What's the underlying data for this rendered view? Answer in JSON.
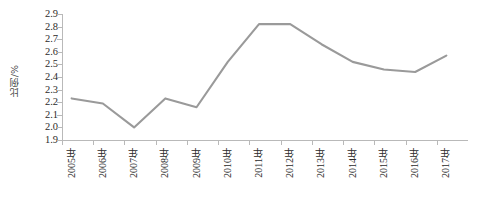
{
  "chart_data": {
    "type": "line",
    "title": "",
    "xlabel": "",
    "ylabel": "比例/%",
    "categories": [
      "2005年",
      "2006年",
      "2007年",
      "2008年",
      "2009年",
      "2010年",
      "2011年",
      "2012年",
      "2013年",
      "2014年",
      "2015年",
      "2016年",
      "2017年"
    ],
    "values": [
      2.23,
      2.19,
      2.0,
      2.23,
      2.16,
      2.52,
      2.82,
      2.82,
      2.66,
      2.52,
      2.46,
      2.44,
      2.57
    ],
    "series": [
      {
        "name": "比例",
        "values": [
          2.23,
          2.19,
          2.0,
          2.23,
          2.16,
          2.52,
          2.82,
          2.82,
          2.66,
          2.52,
          2.46,
          2.44,
          2.57
        ]
      }
    ],
    "ylim": [
      1.9,
      2.9
    ],
    "ytick_labels": [
      "2.9",
      "2.8",
      "2.7",
      "2.6",
      "2.5",
      "2.4",
      "2.3",
      "2.2",
      "2.1",
      "2.0",
      "1.9"
    ],
    "ytick_values": [
      2.9,
      2.8,
      2.7,
      2.6,
      2.5,
      2.4,
      2.3,
      2.2,
      2.1,
      2.0,
      1.9
    ],
    "grid": false,
    "legend": "none",
    "line_color": "#9a9a9a",
    "axis_color": "#b9b9b9",
    "text_color": "#2b2b2b",
    "background": "#ffffff"
  }
}
